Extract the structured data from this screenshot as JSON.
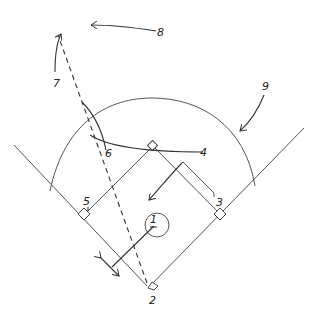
{
  "diagram": {
    "type": "baseball-field-position-diagram",
    "labels": {
      "p1": "1",
      "p2": "2",
      "p3": "3",
      "p4": "4",
      "p5": "5",
      "p6": "6",
      "p7": "7",
      "p8": "8",
      "p9": "9"
    },
    "colors": {
      "line": "#555555",
      "ink": "#333333",
      "background": "#ffffff"
    }
  }
}
